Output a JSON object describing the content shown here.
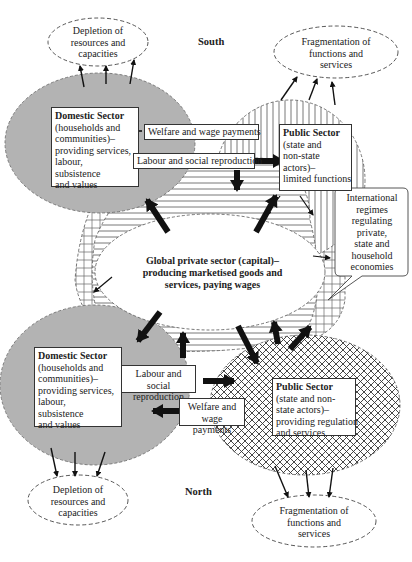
{
  "regions": {
    "south": "South",
    "north": "North"
  },
  "south": {
    "depletion": [
      "Depletion of",
      "resources and",
      "capacities"
    ],
    "fragmentation": [
      "Fragmentation of",
      "functions and",
      "services"
    ],
    "domestic": {
      "title": "Domestic Sector",
      "lines": [
        "(households and",
        "communities)–",
        "providing services,",
        "labour,",
        "subsistence",
        "and values"
      ]
    },
    "public": {
      "title": "Public Sector",
      "lines": [
        "(state and",
        "non-state",
        "actors)–",
        "limited functions"
      ]
    },
    "welfare": "Welfare and wage payments",
    "labour": "Labour and social reproduction"
  },
  "global": {
    "lines": [
      "Global private sector (capital)–",
      "producing marketised goods and",
      "services, paying wages"
    ]
  },
  "international": {
    "lines": [
      "International",
      "regimes",
      "regulating",
      "private,",
      "state and",
      "household",
      "economies"
    ]
  },
  "north": {
    "domestic": {
      "title": "Domestic Sector",
      "lines": [
        "(households and",
        "communities)–",
        "providing services,",
        "labour,",
        "subsistence",
        "and values"
      ]
    },
    "public": {
      "title": "Public Sector",
      "lines": [
        "(state and non-",
        "state actors)–",
        "providing regulation",
        "and services"
      ]
    },
    "labour": [
      "Labour and social",
      "reproduction"
    ],
    "welfare": [
      "Welfare and",
      "wage payments"
    ],
    "depletion": [
      "Depletion of",
      "resources and",
      "capacities"
    ],
    "fragmentation": [
      "Fragmentation of",
      "functions and",
      "services"
    ]
  },
  "colors": {
    "domestic_fill": "#b3b3b3",
    "outline": "#333333",
    "arrow": "#111111"
  }
}
